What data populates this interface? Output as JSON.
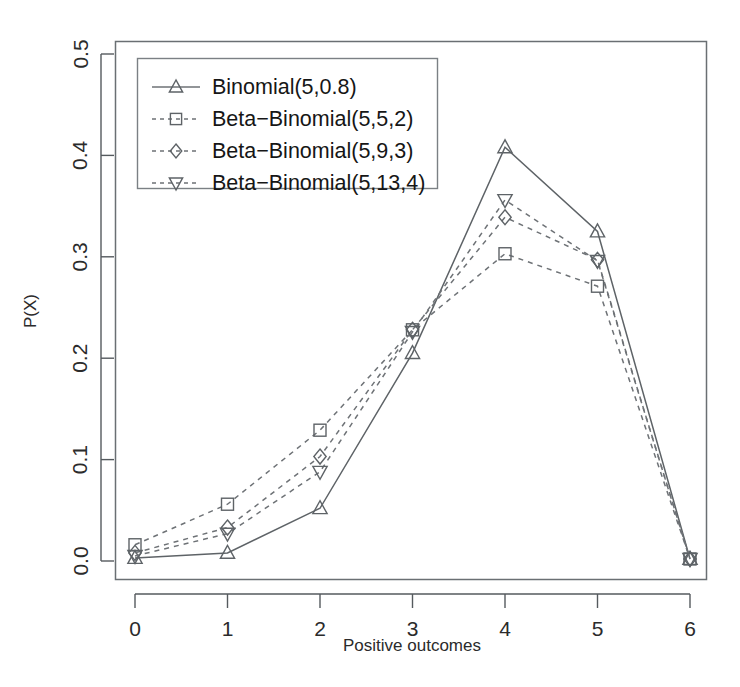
{
  "chart_data": {
    "type": "line",
    "title": "",
    "subtitle": "",
    "xlabel": "Positive outcomes",
    "ylabel": "P(X)",
    "x": [
      0,
      1,
      2,
      3,
      4,
      5,
      6
    ],
    "xticklabels": [
      "0",
      "1",
      "2",
      "3",
      "4",
      "5",
      "6"
    ],
    "yticks": [
      0.0,
      0.1,
      0.2,
      0.3,
      0.4,
      0.5
    ],
    "yticklabels": [
      "0.0",
      "0.1",
      "0.2",
      "0.3",
      "0.4",
      "0.5"
    ],
    "xlim": [
      0,
      6
    ],
    "ylim": [
      0.0,
      0.5
    ],
    "grid": false,
    "legend_position": "top-left",
    "series": [
      {
        "name": "Binomial(5,0.8)",
        "marker": "triangle-up",
        "linestyle": "solid",
        "color": "#5e6367",
        "values": [
          0.003,
          0.008,
          0.052,
          0.205,
          0.408,
          0.325,
          0.002
        ]
      },
      {
        "name": "Beta−Binomial(5,5,2)",
        "marker": "square",
        "linestyle": "dashed",
        "color": "#6e7276",
        "values": [
          0.016,
          0.056,
          0.129,
          0.228,
          0.303,
          0.271,
          0.002
        ]
      },
      {
        "name": "Beta−Binomial(5,9,3)",
        "marker": "diamond",
        "linestyle": "dashed",
        "color": "#6e7276",
        "values": [
          0.008,
          0.033,
          0.103,
          0.228,
          0.339,
          0.297,
          0.002
        ]
      },
      {
        "name": "Beta−Binomial(5,13,4)",
        "marker": "triangle-down",
        "linestyle": "dashed",
        "color": "#6e7276",
        "values": [
          0.005,
          0.027,
          0.088,
          0.226,
          0.356,
          0.296,
          0.002
        ]
      }
    ]
  }
}
